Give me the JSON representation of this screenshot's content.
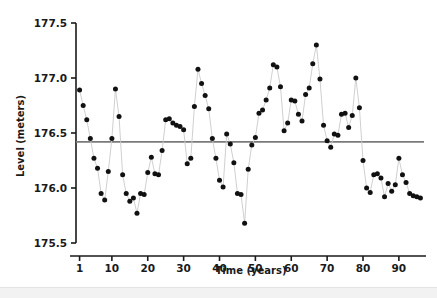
{
  "chart_data": {
    "type": "scatter",
    "title": "",
    "subtitle": "",
    "xlabel": "Time (years)",
    "ylabel": "Level (meters)",
    "xlim": [
      0,
      97
    ],
    "ylim": [
      175.5,
      177.5
    ],
    "xticks": [
      1,
      10,
      20,
      30,
      40,
      50,
      60,
      70,
      80,
      90
    ],
    "xtick_labels": [
      "1",
      "10",
      "20",
      "30",
      "40",
      "50",
      "60",
      "70",
      "80",
      "90"
    ],
    "yticks": [
      175.5,
      176.0,
      176.5,
      177.0,
      177.5
    ],
    "ytick_labels": [
      "175.5",
      "176.0",
      "176.5",
      "177.0",
      "177.5"
    ],
    "grid": false,
    "legend": null,
    "marker": "filled-circle",
    "marker_color": "#111111",
    "line_color": "#c9c9c9",
    "connected": true,
    "reference_line": {
      "orientation": "horizontal",
      "value": 176.42,
      "label": "",
      "color": "#7a7a7a"
    },
    "x": [
      1,
      2,
      3,
      4,
      5,
      6,
      7,
      8,
      9,
      10,
      11,
      12,
      13,
      14,
      15,
      16,
      17,
      18,
      19,
      20,
      21,
      22,
      23,
      24,
      25,
      26,
      27,
      28,
      29,
      30,
      31,
      32,
      33,
      34,
      35,
      36,
      37,
      38,
      39,
      40,
      41,
      42,
      43,
      44,
      45,
      46,
      47,
      48,
      49,
      50,
      51,
      52,
      53,
      54,
      55,
      56,
      57,
      58,
      59,
      60,
      61,
      62,
      63,
      64,
      65,
      66,
      67,
      68,
      69,
      70,
      71,
      72,
      73,
      74,
      75,
      76,
      77,
      78,
      79,
      80,
      81,
      82,
      83,
      84,
      85,
      86,
      87,
      88,
      89,
      90,
      91,
      92,
      93,
      94,
      95,
      96
    ],
    "values": [
      176.89,
      176.75,
      176.62,
      176.45,
      176.27,
      176.18,
      175.95,
      175.89,
      176.15,
      176.45,
      176.9,
      176.65,
      176.12,
      175.95,
      175.88,
      175.91,
      175.77,
      175.95,
      175.94,
      176.14,
      176.28,
      176.13,
      176.12,
      176.34,
      176.62,
      176.63,
      176.59,
      176.57,
      176.56,
      176.53,
      176.22,
      176.27,
      176.74,
      177.08,
      176.95,
      176.84,
      176.72,
      176.45,
      176.27,
      176.07,
      176.01,
      176.49,
      176.4,
      176.23,
      175.95,
      175.94,
      175.68,
      176.17,
      176.39,
      176.46,
      176.68,
      176.71,
      176.8,
      176.91,
      177.12,
      177.1,
      176.92,
      176.52,
      176.59,
      176.8,
      176.79,
      176.67,
      176.61,
      176.85,
      176.91,
      177.13,
      177.3,
      176.99,
      176.57,
      176.43,
      176.37,
      176.49,
      176.48,
      176.67,
      176.68,
      176.55,
      176.66,
      177.0,
      176.73,
      176.25,
      176.0,
      175.96,
      176.12,
      176.13,
      176.09,
      175.92,
      176.04,
      175.97,
      176.03,
      176.27,
      176.12,
      176.05,
      175.95,
      175.93,
      175.92,
      175.91
    ]
  },
  "figure": {
    "background_color": "#ffffff",
    "axis_color": "#1a1a1a"
  }
}
